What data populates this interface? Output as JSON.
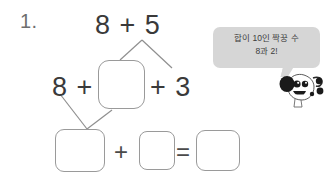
{
  "worksheet": {
    "problem_number": "1.",
    "expression_top": "8 + 5",
    "term_left": "8 +",
    "term_right": "+ 3",
    "plus_bottom": "+",
    "equals_bottom": "=",
    "boxes": {
      "middle": "",
      "sum_left": "",
      "sum_right": "",
      "result": ""
    }
  },
  "hint": {
    "line1": "합이 10인 짝꿍 수",
    "line2": "8과 2!",
    "bubble_color": "#d6d6d6",
    "text_color": "#3d3d3d"
  },
  "character": {
    "name": "dog-character",
    "description": "dalmatian-dog-mascot"
  },
  "colors": {
    "background": "#ffffff",
    "ink": "#3a3a3a",
    "box_border": "#9a9a9a",
    "connector": "#8f8f8f",
    "number_label": "#6e6e6e"
  }
}
